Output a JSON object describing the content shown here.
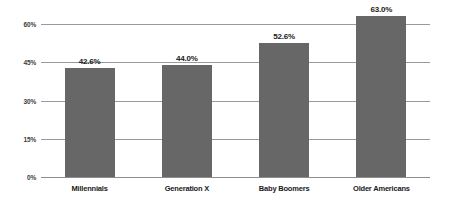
{
  "chart_data": {
    "type": "bar",
    "title": "",
    "xlabel": "",
    "ylabel": "",
    "categories": [
      "Millennials",
      "Generation X",
      "Baby Boomers",
      "Older Americans"
    ],
    "values": [
      42.6,
      44.0,
      52.6,
      63.0
    ],
    "data_labels": [
      "42.6%",
      "44.0%",
      "52.6%",
      "63.0%"
    ],
    "ylim": [
      0,
      60
    ],
    "yticks": [
      0,
      15,
      30,
      45,
      60
    ],
    "ytick_labels": [
      "0%",
      "15%",
      "30%",
      "45%",
      "60%"
    ],
    "grid": true,
    "legend": "none",
    "bar_color": "#676767",
    "gridline_color": "#9a9a9a",
    "label_color": "#1a1a1a",
    "background_color": "#ffffff"
  }
}
